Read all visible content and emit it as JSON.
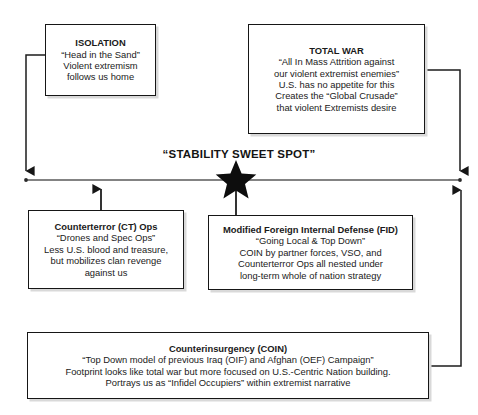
{
  "diagram": {
    "center_label": "“STABILITY SWEET SPOT”",
    "star_marker": "sweet-spot-star"
  },
  "boxes": {
    "isolation": {
      "title": "ISOLATION",
      "lines": [
        "“Head in the Sand”",
        "Violent extremism",
        "follows us home"
      ]
    },
    "total_war": {
      "title": "TOTAL WAR",
      "lines": [
        "“All In Mass Attrition against",
        "our violent extremist enemies”",
        "U.S. has no appetite for this",
        "Creates the “Global Crusade”",
        "that violent Extremists desire"
      ]
    },
    "counterterror": {
      "title": "Counterterror (CT) Ops",
      "lines": [
        "“Drones and Spec Ops”",
        "Less U.S. blood and treasure,",
        "but mobilizes clan revenge",
        "against us"
      ]
    },
    "fid": {
      "title": "Modified Foreign Internal Defense (FID)",
      "lines": [
        "“Going Local & Top Down”",
        "COIN by partner forces, VSO, and",
        "Counterterror Ops all nested under",
        "long-term whole of nation strategy"
      ]
    },
    "coin": {
      "title": "Counterinsurgency (COIN)",
      "lines": [
        "“Top Down model of previous Iraq (OIF) and Afghan (OEF) Campaign”",
        "Footprint looks like total war but more focused on U.S.-Centric Nation building.",
        "Portrays us as “Infidel Occupiers” within extremist narrative"
      ]
    }
  },
  "colors": {
    "stroke": "#161616",
    "line": "#4d4d4d",
    "background": "#ffffff",
    "shadow": "#d9d9d9"
  }
}
